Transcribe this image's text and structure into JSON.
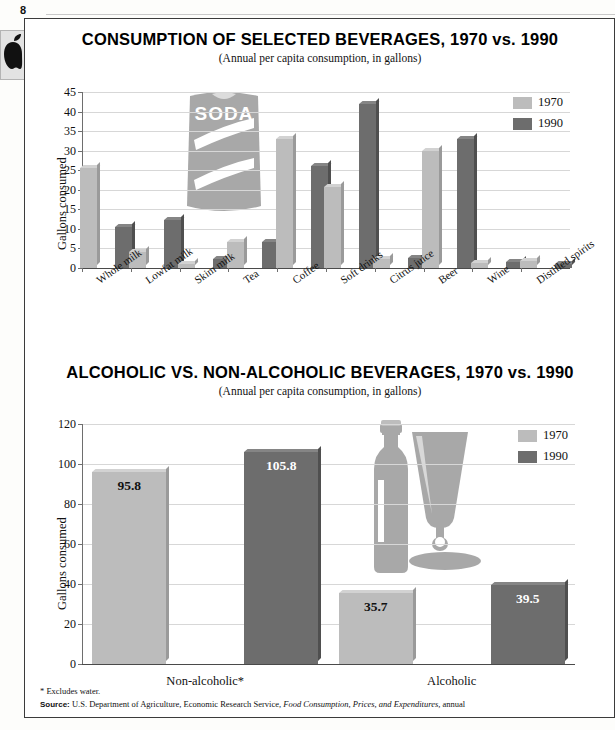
{
  "page": {
    "number": "8"
  },
  "sidebar": {
    "thumbnail_icon": "apple-icon"
  },
  "charts": [
    {
      "title": "CONSUMPTION OF SELECTED BEVERAGES, 1970 vs. 1990",
      "subtitle": "(Annual per capita consumption, in gallons)",
      "ylabel": "Gallons consumed",
      "artwork": "soda-can-illustration",
      "artwork_text": "SODA",
      "legend": [
        {
          "label": "1970",
          "color": "#bcbcbc"
        },
        {
          "label": "1990",
          "color": "#6d6d6d"
        }
      ]
    },
    {
      "title": "ALCOHOLIC VS. NON-ALCOHOLIC BEVERAGES, 1970 vs. 1990",
      "subtitle": "(Annual per capita consumption, in gallons)",
      "ylabel": "Gallons consumed",
      "artwork": "beer-bottle-and-glass-illustration",
      "legend": [
        {
          "label": "1970",
          "color": "#bcbcbc"
        },
        {
          "label": "1990",
          "color": "#6d6d6d"
        }
      ]
    }
  ],
  "footnotes": {
    "asterisk": "* Excludes water.",
    "source_label": "Source:",
    "source_text_1": "U.S. Department of Agriculture, Economic Research Service,",
    "source_italic": "Food Consumption, Prices, and Expenditures,",
    "source_text_2": "annual"
  },
  "chart_data": [
    {
      "type": "bar",
      "title": "CONSUMPTION OF SELECTED BEVERAGES, 1970 vs. 1990",
      "subtitle": "(Annual per capita consumption, in gallons)",
      "xlabel": "",
      "ylabel": "Gallons consumed",
      "ylim": [
        0,
        45
      ],
      "yticks": [
        0,
        5,
        10,
        15,
        20,
        25,
        30,
        35,
        40,
        45
      ],
      "grid": true,
      "legend_position": "top-right",
      "categories": [
        "Whole milk",
        "Lowfat milk",
        "Skim milk",
        "Tea",
        "Coffee",
        "Soft drinks",
        "Citrus juice",
        "Beer",
        "Wine",
        "Distilled spirits"
      ],
      "series": [
        {
          "name": "1970",
          "color": "#bcbcbc",
          "values": [
            25.5,
            4.2,
            1.0,
            6.6,
            33.0,
            20.8,
            2.2,
            30.0,
            1.3,
            1.8
          ]
        },
        {
          "name": "1990",
          "color": "#6d6d6d",
          "values": [
            10.5,
            12.4,
            2.4,
            6.6,
            26.0,
            42.0,
            2.6,
            33.0,
            1.5,
            1.1
          ]
        }
      ]
    },
    {
      "type": "bar",
      "title": "ALCOHOLIC VS. NON-ALCOHOLIC BEVERAGES, 1970 vs. 1990",
      "subtitle": "(Annual per capita consumption, in gallons)",
      "xlabel": "",
      "ylabel": "Gallons consumed",
      "ylim": [
        0,
        120
      ],
      "yticks": [
        0,
        20,
        40,
        60,
        80,
        100,
        120
      ],
      "grid": true,
      "legend_position": "top-right",
      "categories": [
        "Non-alcoholic*",
        "Alcoholic"
      ],
      "series": [
        {
          "name": "1970",
          "color": "#bcbcbc",
          "values": [
            95.8,
            35.7
          ],
          "labels": [
            "95.8",
            "35.7"
          ]
        },
        {
          "name": "1990",
          "color": "#6d6d6d",
          "values": [
            105.8,
            39.5
          ],
          "labels": [
            "105.8",
            "39.5"
          ]
        }
      ]
    }
  ]
}
